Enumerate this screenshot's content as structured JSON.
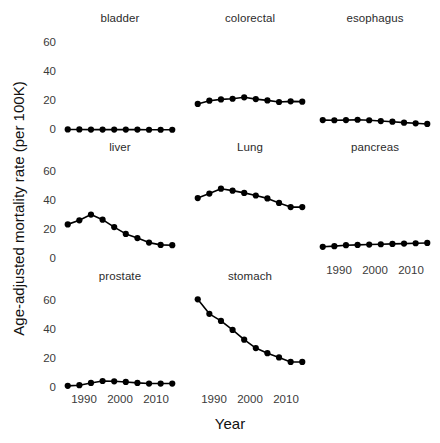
{
  "chart_data": {
    "type": "line",
    "title": "",
    "xlabel": "Year",
    "ylabel": "Age-adjusted mortality rate (per 100K)",
    "layout": "3x3 faceted small multiples (grid of line panels), bottom-right cell empty",
    "grid": false,
    "legend": null,
    "xlim": [
      1986,
      2017
    ],
    "ylim": [
      -4,
      66
    ],
    "yticks": [
      0,
      20,
      40,
      60
    ],
    "ytick_labels": [
      "0",
      "20",
      "40",
      "60"
    ],
    "xticks": [
      1990,
      2000,
      2010
    ],
    "xtick_labels": [
      "1990",
      "2000",
      "2010"
    ],
    "x": [
      1988,
      1991,
      1994,
      1997,
      2000,
      2003,
      2006,
      2009,
      2012,
      2015
    ],
    "marker": "filled-circle",
    "line_color": "#000000",
    "marker_color": "#000000",
    "panels": [
      {
        "name": "bladder",
        "row": 0,
        "col": 0,
        "x": [
          1988,
          1991,
          1994,
          1997,
          2000,
          2003,
          2006,
          2009,
          2012,
          2015
        ],
        "values": [
          4.4,
          4.4,
          4.3,
          4.3,
          4.3,
          4.3,
          4.3,
          4.2,
          4.2,
          4.2
        ]
      },
      {
        "name": "colorectal",
        "row": 0,
        "col": 1,
        "x": [
          1988,
          1991,
          1994,
          1997,
          2000,
          2003,
          2006,
          2009,
          2012,
          2015
        ],
        "values": [
          20.2,
          22.2,
          23.0,
          23.4,
          24.3,
          23.2,
          22.4,
          21.4,
          21.8,
          21.6
        ]
      },
      {
        "name": "esophagus",
        "row": 0,
        "col": 2,
        "x": [
          1988,
          1991,
          1994,
          1997,
          2000,
          2003,
          2006,
          2009,
          2012,
          2015
        ],
        "values": [
          10.2,
          10.1,
          10.2,
          10.4,
          10.1,
          9.6,
          9.2,
          8.6,
          8.2,
          7.8
        ]
      },
      {
        "name": "liver",
        "row": 1,
        "col": 0,
        "x": [
          1988,
          1991,
          1994,
          1997,
          2000,
          2003,
          2006,
          2009,
          2012,
          2015
        ],
        "values": [
          25.5,
          28.0,
          31.6,
          28.4,
          23.8,
          19.6,
          17.0,
          14.2,
          12.8,
          12.6
        ]
      },
      {
        "name": "Lung",
        "row": 1,
        "col": 1,
        "x": [
          1988,
          1991,
          1994,
          1997,
          2000,
          2003,
          2006,
          2009,
          2012,
          2015
        ],
        "values": [
          41.8,
          44.6,
          47.6,
          46.4,
          45.0,
          43.4,
          41.6,
          38.8,
          36.2,
          36.2
        ]
      },
      {
        "name": "pancreas",
        "row": 1,
        "col": 2,
        "x": [
          1988,
          1991,
          1994,
          1997,
          2000,
          2003,
          2006,
          2009,
          2012,
          2015
        ],
        "values": [
          11.6,
          12.0,
          12.6,
          12.8,
          13.0,
          13.2,
          13.4,
          13.6,
          13.8,
          14.0
        ]
      },
      {
        "name": "prostate",
        "row": 2,
        "col": 0,
        "x": [
          1988,
          1991,
          1994,
          1997,
          2000,
          2003,
          2006,
          2009,
          2012,
          2015
        ],
        "values": [
          5.4,
          5.8,
          7.2,
          8.4,
          8.2,
          7.8,
          7.2,
          6.8,
          6.8,
          6.8
        ]
      },
      {
        "name": "stomach",
        "row": 2,
        "col": 1,
        "x": [
          1988,
          1991,
          1994,
          1997,
          2000,
          2003,
          2006,
          2009,
          2012,
          2015
        ],
        "values": [
          59.0,
          50.0,
          45.6,
          40.0,
          34.0,
          28.8,
          25.6,
          23.0,
          20.2,
          20.2
        ]
      }
    ]
  },
  "axes": {
    "y_title": "Age-adjusted mortality rate (per 100K)",
    "x_title": "Year",
    "ytick_0": "0",
    "ytick_20": "20",
    "ytick_40": "40",
    "ytick_60": "60",
    "xtick_1990": "1990",
    "xtick_2000": "2000",
    "xtick_2010": "2010"
  },
  "panel_titles": {
    "bladder": "bladder",
    "colorectal": "colorectal",
    "esophagus": "esophagus",
    "liver": "liver",
    "lung": "Lung",
    "pancreas": "pancreas",
    "prostate": "prostate",
    "stomach": "stomach"
  }
}
